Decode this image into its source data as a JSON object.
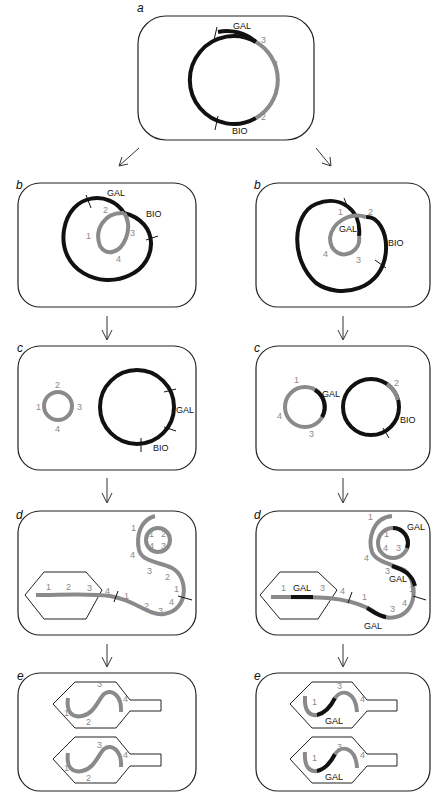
{
  "figure": {
    "panels": {
      "a": {
        "letter": "a",
        "gal": "GAL",
        "bio": "BIO",
        "n1": "1",
        "n2": "2",
        "n3": "3",
        "n4": "4"
      },
      "b_left": {
        "letter": "b",
        "gal": "GAL",
        "bio": "BIO",
        "n1": "1",
        "n2": "2",
        "n3": "3",
        "n4": "4"
      },
      "b_right": {
        "letter": "b",
        "gal": "GAL",
        "bio": "BIO",
        "n1": "1",
        "n2": "2",
        "n3": "3",
        "n4": "4"
      },
      "c_left": {
        "letter": "c",
        "gal": "GAL",
        "bio": "BIO",
        "n1": "1",
        "n2": "2",
        "n3": "3",
        "n4": "4"
      },
      "c_right": {
        "letter": "c",
        "gal": "GAL",
        "bio": "BIO",
        "n1": "1",
        "n2": "2",
        "n3": "3",
        "n4": "4"
      },
      "d_left": {
        "letter": "d",
        "n1": "1",
        "n2": "2",
        "n3": "3",
        "n4": "4"
      },
      "d_right": {
        "letter": "d",
        "gal": "GAL",
        "n1": "1",
        "n2": "2",
        "n3": "3",
        "n4": "4"
      },
      "e_left": {
        "letter": "e",
        "n1": "1",
        "n2": "2",
        "n3": "3",
        "n4": "4"
      },
      "e_right": {
        "letter": "e",
        "gal": "GAL",
        "n1": "1",
        "n3": "3",
        "n4": "4"
      }
    },
    "colors": {
      "host_dna": "#111111",
      "phage_dna": "#8a8a8a",
      "outline": "#222222"
    }
  }
}
